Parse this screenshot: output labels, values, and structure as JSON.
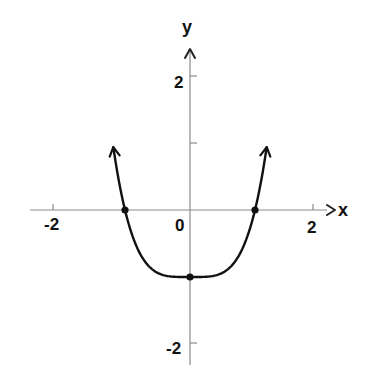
{
  "chart_data": {
    "type": "line",
    "title": "",
    "xlabel": "x",
    "ylabel": "y",
    "xlim": [
      -2.3,
      2.3
    ],
    "ylim": [
      -2.4,
      2.4
    ],
    "grid": false,
    "legend": null,
    "x_ticks": [
      -2,
      2
    ],
    "x_tick_labels": [
      "-2",
      "2"
    ],
    "y_ticks": [
      -2,
      1,
      2
    ],
    "y_tick_labels": [
      "-2",
      "",
      "2"
    ],
    "origin_label": "0",
    "function": "y = x^4 - 1",
    "series": [
      {
        "name": "curve",
        "x": [
          -1.18,
          -1.1,
          -1.0,
          -0.8,
          -0.6,
          -0.4,
          -0.2,
          0.0,
          0.2,
          0.4,
          0.6,
          0.8,
          1.0,
          1.1,
          1.18
        ],
        "y": [
          0.94,
          0.46,
          0.0,
          -0.59,
          -0.87,
          -0.97,
          -1.0,
          -1.0,
          -1.0,
          -0.97,
          -0.87,
          -0.59,
          0.0,
          0.46,
          0.94
        ],
        "arrows_at_ends": true
      }
    ],
    "marked_points": [
      {
        "x": -1,
        "y": 0,
        "label": "x-intercept"
      },
      {
        "x": 0,
        "y": -1,
        "label": "y-intercept / minimum"
      },
      {
        "x": 1,
        "y": 0,
        "label": "x-intercept"
      }
    ]
  },
  "labels": {
    "x_axis": "x",
    "y_axis": "y",
    "origin": "0",
    "x_neg2": "-2",
    "x_pos2": "2",
    "y_pos2": "2",
    "y_neg2": "-2"
  }
}
